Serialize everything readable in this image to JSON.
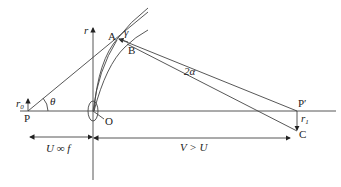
{
  "diagram": {
    "points": {
      "A": "A",
      "B": "B",
      "P": "P",
      "P_prime": "P′",
      "O": "O",
      "C": "C"
    },
    "symbols": {
      "r_axis": "r",
      "r0": "r",
      "r0_sub": "0",
      "r1": "r",
      "r1_sub": "1",
      "theta": "θ",
      "gamma": "γ",
      "two_alpha": "2α"
    },
    "dimensions": {
      "left_span": "U ∞ f",
      "right_span": "V > U"
    },
    "colors": {
      "line": "#444444",
      "background": "#ffffff"
    }
  }
}
